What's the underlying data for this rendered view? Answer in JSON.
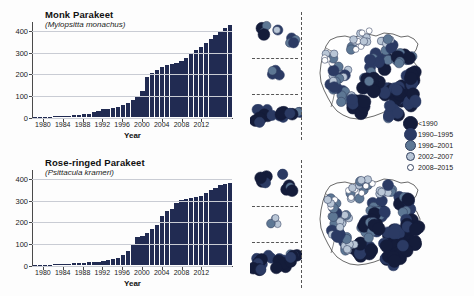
{
  "figure": {
    "background": "#fdfdfd",
    "bar_color": "#212b52",
    "axis_color": "#4a4a4a",
    "grid_color": "#c9ccd4"
  },
  "legend": {
    "name": "colonisation-period-legend",
    "items": [
      {
        "label": "<1990",
        "color": "#141c3a",
        "size": 7.5,
        "ring": "#141c3a"
      },
      {
        "label": "1990–1995",
        "color": "#2b3a63",
        "size": 6.5,
        "ring": "#2b3a63"
      },
      {
        "label": "1996–2001",
        "color": "#5d7794",
        "size": 5.5,
        "ring": "#33415f"
      },
      {
        "label": "2002–2007",
        "color": "#b9c6d6",
        "size": 4.5,
        "ring": "#33415f"
      },
      {
        "label": "2008–2015",
        "color": "#ffffff",
        "size": 3.5,
        "ring": "#33415f"
      }
    ]
  },
  "chart_data": [
    {
      "type": "bar",
      "panel": "top",
      "title": "Monk Parakeet",
      "subtitle": "(Myiopsitta monachus)",
      "xlabel": "Year",
      "ylabel": "",
      "ylim": [
        0,
        440
      ],
      "yticks": [
        0,
        100,
        200,
        300,
        400
      ],
      "grid": true,
      "legend_position": "none",
      "xticks": [
        1980,
        1984,
        1988,
        1992,
        1996,
        2000,
        2004,
        2008,
        2012
      ],
      "x": [
        1978,
        1979,
        1980,
        1981,
        1982,
        1983,
        1984,
        1985,
        1986,
        1987,
        1988,
        1989,
        1990,
        1991,
        1992,
        1993,
        1994,
        1995,
        1996,
        1997,
        1998,
        1999,
        2000,
        2001,
        2002,
        2003,
        2004,
        2005,
        2006,
        2007,
        2008,
        2009,
        2010,
        2011,
        2012,
        2013,
        2014,
        2015
      ],
      "values": [
        1,
        1,
        2,
        2,
        3,
        4,
        5,
        6,
        8,
        10,
        13,
        16,
        22,
        28,
        36,
        38,
        40,
        46,
        55,
        62,
        78,
        96,
        120,
        185,
        200,
        215,
        230,
        238,
        242,
        248,
        258,
        272,
        292,
        305,
        320,
        340,
        358,
        378,
        392,
        410,
        420
      ],
      "categories": [
        "1978",
        "1979",
        "1980",
        "1981",
        "1982",
        "1983",
        "1984",
        "1985",
        "1986",
        "1987",
        "1988",
        "1989",
        "1990",
        "1991",
        "1992",
        "1993",
        "1994",
        "1995",
        "1996",
        "1997",
        "1998",
        "1999",
        "2000",
        "2001",
        "2002",
        "2003",
        "2004",
        "2005",
        "2006",
        "2007",
        "2008",
        "2009",
        "2010",
        "2011",
        "2012",
        "2013",
        "2014",
        "2015"
      ],
      "map_caption": ""
    },
    {
      "type": "bar",
      "panel": "bottom",
      "title": "Rose-ringed Parakeet",
      "subtitle": "(Psittacula krameri)",
      "xlabel": "Year",
      "ylabel": "",
      "ylim": [
        0,
        440
      ],
      "yticks": [
        0,
        100,
        200,
        300,
        400
      ],
      "grid": true,
      "legend_position": "none",
      "xticks": [
        1980,
        1984,
        1988,
        1992,
        1996,
        2000,
        2004,
        2008,
        2012
      ],
      "x": [
        1978,
        1979,
        1980,
        1981,
        1982,
        1983,
        1984,
        1985,
        1986,
        1987,
        1988,
        1989,
        1990,
        1991,
        1992,
        1993,
        1994,
        1995,
        1996,
        1997,
        1998,
        1999,
        2000,
        2001,
        2002,
        2003,
        2004,
        2005,
        2006,
        2007,
        2008,
        2009,
        2010,
        2011,
        2012,
        2013,
        2014,
        2015
      ],
      "values": [
        1,
        1,
        2,
        2,
        3,
        4,
        5,
        6,
        7,
        8,
        10,
        12,
        14,
        16,
        20,
        22,
        28,
        34,
        44,
        62,
        95,
        128,
        132,
        148,
        165,
        185,
        225,
        248,
        258,
        282,
        298,
        302,
        308,
        312,
        318,
        332,
        345,
        355,
        368,
        372,
        378
      ],
      "categories": [
        "1978",
        "1979",
        "1980",
        "1981",
        "1982",
        "1983",
        "1984",
        "1985",
        "1986",
        "1987",
        "1988",
        "1989",
        "1990",
        "1991",
        "1992",
        "1993",
        "1994",
        "1995",
        "1996",
        "1997",
        "1998",
        "1999",
        "2000",
        "2001",
        "2002",
        "2003",
        "2004",
        "2005",
        "2006",
        "2007",
        "2008",
        "2009",
        "2010",
        "2011",
        "2012",
        "2013",
        "2014",
        "2015"
      ],
      "map_caption": ""
    }
  ]
}
